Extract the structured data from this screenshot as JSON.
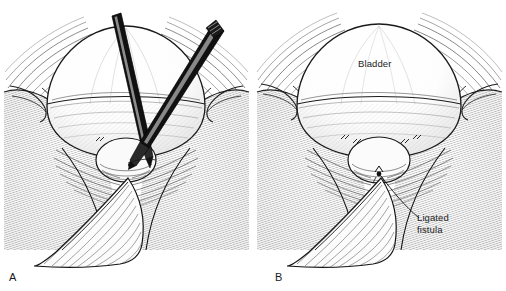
{
  "figure": {
    "background_color": "#ffffff",
    "ink_color": "#1a1a1a",
    "style": "pen-and-ink medical engraving"
  },
  "panels": [
    {
      "id": "A",
      "letter": "A",
      "caption_position": "bottom-left",
      "description": "Surgical exposure with two instruments dissecting the fistula",
      "instruments": [
        {
          "name": "dissecting-forceps-left",
          "color": "#111111"
        },
        {
          "name": "clamp-right",
          "color": "#111111"
        }
      ]
    },
    {
      "id": "B",
      "letter": "B",
      "caption_position": "bottom-left",
      "description": "Completed repair showing sutured bladder and ligated fistula",
      "annotations": [
        {
          "name": "bladder",
          "text": "Bladder",
          "leader": false
        },
        {
          "name": "ligated-fistula",
          "text": "Ligated\nfistula",
          "leader": true
        }
      ]
    }
  ],
  "labels": {
    "bladder": "Bladder",
    "ligated_fistula_line1": "Ligated",
    "ligated_fistula_line2": "fistula",
    "panel_a_letter": "A",
    "panel_b_letter": "B"
  }
}
